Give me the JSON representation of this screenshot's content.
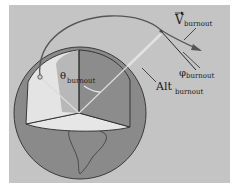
{
  "diagram": {
    "labels": {
      "velocity": {
        "main": "V",
        "sub": "burnout",
        "accent": "vector-arrow"
      },
      "flight_path_angle": {
        "main": "φ",
        "sub": "burnout"
      },
      "altitude": {
        "main": "Alt",
        "sub": "burnout"
      },
      "downrange_angle": {
        "main": "θ",
        "sub": "burnout"
      }
    },
    "colors": {
      "background": "#c4c4c4",
      "globe": "#8a8a8a",
      "globe_outline": "#3a3a3a",
      "cutaway_light": "#e6e6e6",
      "cutaway_mid": "#b8b8b8",
      "cutaway_dark": "#8c8c8c",
      "trajectory": "#555555",
      "radial_line": "#dcdcdc"
    }
  }
}
